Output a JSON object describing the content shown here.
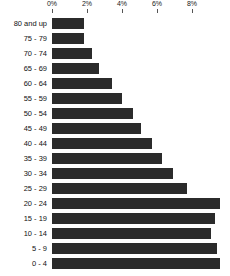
{
  "chart_data": {
    "type": "bar",
    "orientation": "horizontal",
    "title": "",
    "subtitle": "",
    "xlabel": "",
    "ylabel": "",
    "xlim": [
      0,
      9.9
    ],
    "grid": false,
    "legend": null,
    "bar_color": "#2b2b2b",
    "axis_position": "top",
    "tick_labels": [
      "0%",
      "2%",
      "4%",
      "6%",
      "8%"
    ],
    "tick_values": [
      0,
      2,
      4,
      6,
      8
    ],
    "categories": [
      "80 and up",
      "75 - 79",
      "70 - 74",
      "65 - 69",
      "60 - 64",
      "55 - 59",
      "50 - 54",
      "45 - 49",
      "40 - 44",
      "35 - 39",
      "30 - 34",
      "25 - 29",
      "20 - 24",
      "15 - 19",
      "10 - 14",
      "5 - 9",
      "0 - 4"
    ],
    "values": [
      1.8,
      1.8,
      2.3,
      2.7,
      3.4,
      4.0,
      4.6,
      5.1,
      5.7,
      6.3,
      6.9,
      7.7,
      9.6,
      9.3,
      9.1,
      9.4,
      9.6
    ]
  }
}
